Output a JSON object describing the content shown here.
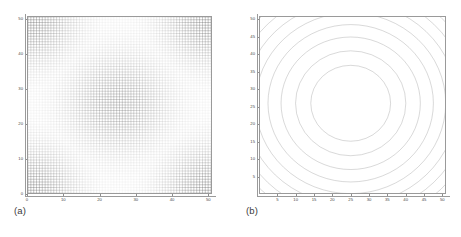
{
  "figure": {
    "panels": [
      {
        "id": "a",
        "label": "(a)",
        "kind": "mesh-grid"
      },
      {
        "id": "b",
        "label": "(b)",
        "kind": "contour"
      }
    ]
  },
  "chart_data": [
    {
      "type": "heatmap",
      "panel": "a",
      "title": "",
      "subtitle": "",
      "xlabel": "",
      "ylabel": "",
      "xlim": [
        0,
        51
      ],
      "ylim": [
        0,
        51
      ],
      "grid": true,
      "legend": "none",
      "description": "Adaptive mesh / grid density map over a square domain. Mesh lines are darkest (densest refinement) in the four corners and within a circular region near the domain centre; the annular band between the centre disc and the corners is the lightest.",
      "xticks": [
        0,
        10,
        20,
        30,
        40,
        50
      ],
      "xticklabels": [
        "0",
        "10",
        "20",
        "30",
        "40",
        "50"
      ],
      "yticks": [
        0,
        10,
        20,
        30,
        40,
        50
      ],
      "yticklabels": [
        "0",
        "10",
        "20",
        "30",
        "40",
        "50"
      ],
      "mesh": {
        "nx": 64,
        "ny": 64,
        "cell_size": 0.8,
        "density_centers": [
          {
            "cx": 0,
            "cy": 0,
            "weight": 1.0,
            "radius": 14
          },
          {
            "cx": 51,
            "cy": 0,
            "weight": 1.0,
            "radius": 14
          },
          {
            "cx": 0,
            "cy": 51,
            "weight": 1.0,
            "radius": 14
          },
          {
            "cx": 51,
            "cy": 51,
            "weight": 1.0,
            "radius": 14
          },
          {
            "cx": 25,
            "cy": 26,
            "weight": 0.78,
            "radius": 15
          }
        ],
        "min_line_opacity": 0.05,
        "max_line_opacity": 0.75,
        "line_color": "#555555"
      }
    },
    {
      "type": "line",
      "panel": "b",
      "title": "",
      "subtitle": "",
      "xlabel": "",
      "ylabel": "",
      "xlim": [
        0,
        51
      ],
      "ylim": [
        0,
        51
      ],
      "grid": false,
      "legend": "none",
      "description": "Contour plot of a radially symmetric field centred near (25, 26). Level curves form nested near-circular rings; in the four corners the contours bunch into closely spaced arcs indicating steep gradients.",
      "xticks": [
        5,
        10,
        15,
        20,
        25,
        30,
        35,
        40,
        45,
        50
      ],
      "xticklabels": [
        "5",
        "10",
        "15",
        "20",
        "25",
        "30",
        "35",
        "40",
        "45",
        "50"
      ],
      "yticks": [
        5,
        10,
        15,
        20,
        25,
        30,
        35,
        40,
        45,
        50
      ],
      "yticklabels": [
        "5",
        "10",
        "15",
        "20",
        "25",
        "30",
        "35",
        "40",
        "45",
        "50"
      ],
      "contours": {
        "center": [
          25,
          26
        ],
        "radii": [
          11.0,
          15.2,
          19.2,
          22.8,
          26.2,
          29.4,
          32.4,
          35.2,
          37.8,
          40.2,
          42.5,
          44.6
        ],
        "line_color": "#8a8a8a",
        "line_width": 0.6,
        "n_levels": 12
      }
    }
  ],
  "colors": {
    "frame": "#9a9a9a",
    "tick_text": "#4a4a4a",
    "mesh_line": "#555555",
    "contour_line": "#8a8a8a",
    "background": "#ffffff"
  }
}
